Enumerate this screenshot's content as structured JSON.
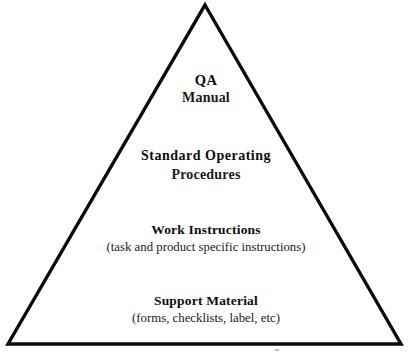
{
  "diagram": {
    "type": "pyramid",
    "shape_name": "triangle-outline",
    "background_color": "#ffffff",
    "outline_color": "#000000",
    "outline_width_px": 3,
    "apex": {
      "x": 205,
      "y": 5
    },
    "bottom_left": {
      "x": 8,
      "y": 344
    },
    "bottom_right": {
      "x": 401,
      "y": 344
    },
    "tiers": [
      {
        "level": 1,
        "title": "QA",
        "subtitle": "Manual"
      },
      {
        "level": 2,
        "title": "Standard Operating",
        "subtitle": "Procedures"
      },
      {
        "level": 3,
        "title": "Work Instructions",
        "subtitle": "(task and product specific instructions)"
      },
      {
        "level": 4,
        "title": "Support Material",
        "subtitle": "(forms, checklists, label, etc)"
      }
    ]
  }
}
